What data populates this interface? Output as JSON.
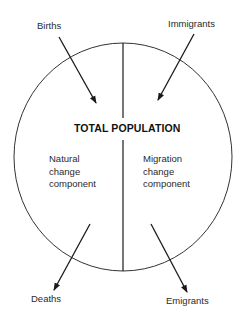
{
  "diagram": {
    "title": "TOTAL POPULATION",
    "components": {
      "left": {
        "lines": [
          "Natural",
          "change",
          "component"
        ]
      },
      "right": {
        "lines": [
          "Migration",
          "change",
          "component"
        ]
      }
    },
    "flows": {
      "births": {
        "label": "Births",
        "direction": "in"
      },
      "immigrants": {
        "label": "Immigrants",
        "direction": "in"
      },
      "deaths": {
        "label": "Deaths",
        "direction": "out"
      },
      "emigrants": {
        "label": "Emigrants",
        "direction": "out"
      }
    },
    "colors": {
      "stroke": "#1a1a1a",
      "background": "#ffffff"
    }
  }
}
